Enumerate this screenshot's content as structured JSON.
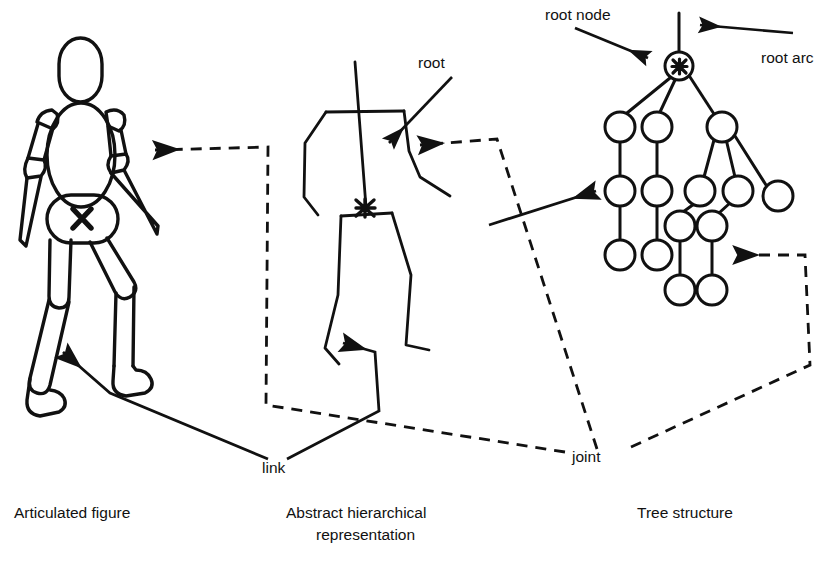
{
  "diagram": {
    "title_captions": [
      {
        "id": "articulated",
        "text": "Articulated figure",
        "x": 14,
        "y": 518
      },
      {
        "id": "abstract-line1",
        "text": "Abstract hierarchical",
        "x": 286,
        "y": 518
      },
      {
        "id": "abstract-line2",
        "text": "representation",
        "x": 316,
        "y": 540
      },
      {
        "id": "tree",
        "text": "Tree structure",
        "x": 637,
        "y": 518
      }
    ],
    "annotations": [
      {
        "id": "root",
        "text": "root",
        "x": 418,
        "y": 68
      },
      {
        "id": "root-node",
        "text": "root node",
        "x": 545,
        "y": 20
      },
      {
        "id": "root-arc",
        "text": "root arc",
        "x": 761,
        "y": 63
      },
      {
        "id": "link",
        "text": "link",
        "x": 262,
        "y": 473
      },
      {
        "id": "joint",
        "text": "joint",
        "x": 572,
        "y": 462
      }
    ],
    "markers": [
      {
        "id": "pelvis-root-marker",
        "glyph": "X",
        "x": 82,
        "y": 218
      },
      {
        "id": "abstract-root-marker",
        "glyph": "X",
        "x": 365,
        "y": 208
      },
      {
        "id": "tree-root-marker",
        "glyph": "X",
        "x": 679,
        "y": 67
      }
    ],
    "colors": {
      "stroke": "#111111",
      "background": "#ffffff",
      "text": "#111111"
    },
    "panels": [
      {
        "id": "panel-articulated",
        "caption": "Articulated figure"
      },
      {
        "id": "panel-abstract",
        "caption": "Abstract hierarchical representation"
      },
      {
        "id": "panel-tree",
        "caption": "Tree structure"
      }
    ],
    "tree_nodes": [
      {
        "id": "n-root",
        "x": 679,
        "y": 66,
        "r": 14,
        "marked": true
      },
      {
        "id": "n-a",
        "x": 620,
        "y": 127,
        "r": 15,
        "marked": false
      },
      {
        "id": "n-b",
        "x": 657,
        "y": 127,
        "r": 15,
        "marked": false
      },
      {
        "id": "n-c",
        "x": 722,
        "y": 127,
        "r": 15,
        "marked": false
      },
      {
        "id": "n-d",
        "x": 620,
        "y": 191,
        "r": 15,
        "marked": false
      },
      {
        "id": "n-e",
        "x": 657,
        "y": 191,
        "r": 15,
        "marked": false
      },
      {
        "id": "n-f",
        "x": 700,
        "y": 191,
        "r": 15,
        "marked": false
      },
      {
        "id": "n-g",
        "x": 738,
        "y": 191,
        "r": 15,
        "marked": false
      },
      {
        "id": "n-h",
        "x": 778,
        "y": 196,
        "r": 15,
        "marked": false
      },
      {
        "id": "n-i",
        "x": 620,
        "y": 255,
        "r": 15,
        "marked": false
      },
      {
        "id": "n-j",
        "x": 657,
        "y": 255,
        "r": 15,
        "marked": false
      },
      {
        "id": "n-k",
        "x": 680,
        "y": 226,
        "r": 15,
        "marked": false
      },
      {
        "id": "n-l",
        "x": 712,
        "y": 226,
        "r": 15,
        "marked": false
      },
      {
        "id": "n-m",
        "x": 680,
        "y": 290,
        "r": 15,
        "marked": false
      },
      {
        "id": "n-n",
        "x": 712,
        "y": 290,
        "r": 15,
        "marked": false
      }
    ],
    "tree_edges": [
      {
        "from": "root-arc-top",
        "to": "n-root"
      },
      {
        "from": "n-root",
        "to": "n-a"
      },
      {
        "from": "n-root",
        "to": "n-b"
      },
      {
        "from": "n-root",
        "to": "n-c"
      },
      {
        "from": "n-a",
        "to": "n-d"
      },
      {
        "from": "n-b",
        "to": "n-e"
      },
      {
        "from": "n-c",
        "to": "n-f"
      },
      {
        "from": "n-c",
        "to": "n-g"
      },
      {
        "from": "n-c",
        "to": "n-h"
      },
      {
        "from": "n-d",
        "to": "n-i"
      },
      {
        "from": "n-e",
        "to": "n-j"
      },
      {
        "from": "n-f",
        "to": "n-k"
      },
      {
        "from": "n-g",
        "to": "n-l"
      },
      {
        "from": "n-k",
        "to": "n-m"
      },
      {
        "from": "n-l",
        "to": "n-n"
      }
    ]
  }
}
